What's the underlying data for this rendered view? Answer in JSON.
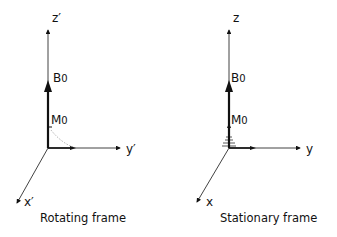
{
  "panels": [
    {
      "caption": "Rotating frame",
      "axes": {
        "z": "z′",
        "y": "y′",
        "x": "x′"
      },
      "field_label": "B",
      "field_sub": "0",
      "magnetization_label": "M",
      "magnetization_sub": "0"
    },
    {
      "caption": "Stationary frame",
      "axes": {
        "z": "z",
        "y": "y",
        "x": "x"
      },
      "field_label": "B",
      "field_sub": "0",
      "magnetization_label": "M",
      "magnetization_sub": "0"
    }
  ],
  "colors": {
    "ink": "#111111",
    "background": "#ffffff",
    "dotted": "#999999"
  }
}
